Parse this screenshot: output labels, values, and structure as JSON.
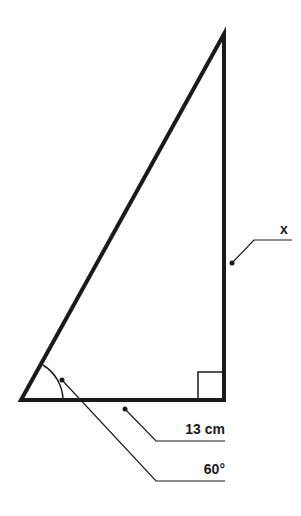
{
  "diagram": {
    "type": "right-triangle",
    "labels": {
      "opposite_side": "x",
      "adjacent_side": "13 cm",
      "angle": "60°"
    },
    "colors": {
      "stroke": "#1a1a1a",
      "background": "#ffffff"
    }
  }
}
